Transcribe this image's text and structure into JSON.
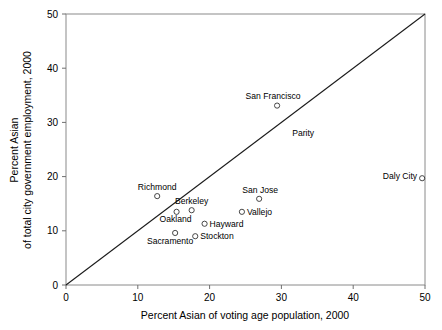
{
  "chart_data": {
    "type": "scatter",
    "title": "",
    "xlabel": "Percent Asian of voting age population, 2000",
    "ylabel_line1": "Percent Asian",
    "ylabel_line2": "of total city government employment, 2000",
    "xlim": [
      0,
      50
    ],
    "ylim": [
      0,
      50
    ],
    "xticks": [
      0,
      10,
      20,
      30,
      40,
      50
    ],
    "yticks": [
      0,
      10,
      20,
      30,
      40,
      50
    ],
    "xtick_labels": [
      "0",
      "10",
      "20",
      "30",
      "40",
      "50"
    ],
    "ytick_labels": [
      "0",
      "10",
      "20",
      "30",
      "40",
      "50"
    ],
    "grid": false,
    "legend": "none",
    "marker_style": "open-circle",
    "annotations": [
      {
        "name": "parity",
        "text": "Parity",
        "x": 31.5,
        "y": 27.5,
        "anchor": "start"
      }
    ],
    "reference_line": {
      "name": "parity-line",
      "label": "Parity",
      "from": [
        0,
        0
      ],
      "to": [
        50,
        50
      ],
      "slope": 1,
      "intercept": 0
    },
    "points": [
      {
        "label": "San Francisco",
        "x": 29.4,
        "y": 33.1,
        "label_dx": -4,
        "label_dy": -7,
        "label_anchor": "middle"
      },
      {
        "label": "Daly City",
        "x": 49.6,
        "y": 19.7,
        "label_dx": -5,
        "label_dy": 1,
        "label_anchor": "end"
      },
      {
        "label": "Richmond",
        "x": 12.7,
        "y": 16.4,
        "label_dx": 0,
        "label_dy": -6,
        "label_anchor": "middle"
      },
      {
        "label": "San Jose",
        "x": 26.9,
        "y": 15.9,
        "label_dx": 1,
        "label_dy": -6,
        "label_anchor": "middle"
      },
      {
        "label": "Berkeley",
        "x": 17.5,
        "y": 13.8,
        "label_dx": 0,
        "label_dy": -6,
        "label_anchor": "middle"
      },
      {
        "label": "Oakland",
        "x": 15.4,
        "y": 13.5,
        "label_dx": -1,
        "label_dy": 10,
        "label_anchor": "middle"
      },
      {
        "label": "Vallejo",
        "x": 24.5,
        "y": 13.5,
        "label_dx": 5,
        "label_dy": 3,
        "label_anchor": "start"
      },
      {
        "label": "Hayward",
        "x": 19.3,
        "y": 11.3,
        "label_dx": 5,
        "label_dy": 3,
        "label_anchor": "start"
      },
      {
        "label": "Sacramento",
        "x": 15.2,
        "y": 9.6,
        "label_dx": -5,
        "label_dy": 11,
        "label_anchor": "middle"
      },
      {
        "label": "Stockton",
        "x": 18.0,
        "y": 9.0,
        "label_dx": 5,
        "label_dy": 3,
        "label_anchor": "start"
      }
    ]
  },
  "colors": {
    "background": "#ffffff",
    "frame": "#8a8a8a",
    "axis": "#6f6f6f",
    "line": "#1a1a1a",
    "marker": "#333333",
    "text": "#000000"
  }
}
